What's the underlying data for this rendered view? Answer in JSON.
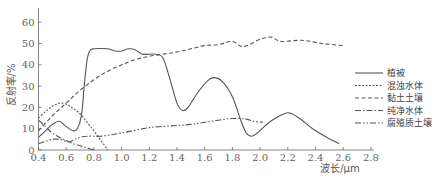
{
  "chart_data": {
    "type": "line",
    "title": "",
    "xlabel": "波长/μm",
    "ylabel": "反射率/%",
    "xlim": [
      0.4,
      2.8
    ],
    "ylim": [
      0,
      65
    ],
    "xticks": [
      0.4,
      0.6,
      0.8,
      1.0,
      1.2,
      1.4,
      1.6,
      1.8,
      2.0,
      2.2,
      2.4,
      2.6,
      2.8
    ],
    "xtick_labels": [
      "0.4",
      "0.6",
      "0.8",
      "1.0",
      "1.2",
      "1.4",
      "1.6",
      "1.8",
      "2.0",
      "2.2",
      "2.4",
      "2.6",
      "2.8"
    ],
    "yticks": [
      0,
      10,
      20,
      30,
      40,
      50,
      60
    ],
    "ytick_labels": [
      "0",
      "10",
      "20",
      "30",
      "40",
      "50",
      "60"
    ],
    "grid": false,
    "legend_position": "right",
    "series": [
      {
        "name": "植被",
        "style": "solid",
        "points": [
          [
            0.4,
            6
          ],
          [
            0.45,
            9
          ],
          [
            0.5,
            12
          ],
          [
            0.55,
            13.5
          ],
          [
            0.6,
            11
          ],
          [
            0.65,
            9
          ],
          [
            0.68,
            10
          ],
          [
            0.71,
            16
          ],
          [
            0.73,
            30
          ],
          [
            0.75,
            42
          ],
          [
            0.77,
            46.5
          ],
          [
            0.8,
            47.5
          ],
          [
            0.9,
            47.5
          ],
          [
            0.95,
            46.5
          ],
          [
            1.0,
            46.5
          ],
          [
            1.05,
            47.5
          ],
          [
            1.1,
            47
          ],
          [
            1.15,
            45
          ],
          [
            1.25,
            45
          ],
          [
            1.3,
            43
          ],
          [
            1.35,
            33
          ],
          [
            1.4,
            22
          ],
          [
            1.44,
            18.5
          ],
          [
            1.48,
            20
          ],
          [
            1.55,
            27
          ],
          [
            1.62,
            32.5
          ],
          [
            1.67,
            34
          ],
          [
            1.73,
            32
          ],
          [
            1.8,
            25
          ],
          [
            1.86,
            14
          ],
          [
            1.9,
            8
          ],
          [
            1.94,
            6.5
          ],
          [
            1.98,
            8
          ],
          [
            2.03,
            11
          ],
          [
            2.1,
            14.5
          ],
          [
            2.2,
            17.5
          ],
          [
            2.28,
            15
          ],
          [
            2.38,
            10
          ],
          [
            2.48,
            6
          ],
          [
            2.57,
            3
          ]
        ]
      },
      {
        "name": "混浊水体",
        "style": "dotted",
        "points": [
          [
            0.4,
            15
          ],
          [
            0.45,
            18
          ],
          [
            0.5,
            20.5
          ],
          [
            0.55,
            22
          ],
          [
            0.6,
            21.5
          ],
          [
            0.65,
            19.5
          ],
          [
            0.7,
            17
          ],
          [
            0.75,
            13
          ],
          [
            0.8,
            9
          ],
          [
            0.85,
            4.5
          ],
          [
            0.9,
            0
          ]
        ]
      },
      {
        "name": "黏土土壤",
        "style": "dashed",
        "points": [
          [
            0.4,
            9
          ],
          [
            0.5,
            16
          ],
          [
            0.6,
            22
          ],
          [
            0.7,
            28
          ],
          [
            0.8,
            33
          ],
          [
            0.9,
            37
          ],
          [
            1.0,
            40
          ],
          [
            1.1,
            42.5
          ],
          [
            1.2,
            44
          ],
          [
            1.3,
            45
          ],
          [
            1.4,
            46
          ],
          [
            1.5,
            47.5
          ],
          [
            1.6,
            49
          ],
          [
            1.7,
            49.5
          ],
          [
            1.8,
            51
          ],
          [
            1.88,
            48.5
          ],
          [
            2.0,
            52
          ],
          [
            2.08,
            53
          ],
          [
            2.15,
            51
          ],
          [
            2.3,
            51.5
          ],
          [
            2.45,
            50
          ],
          [
            2.6,
            49
          ]
        ]
      },
      {
        "name": "纯净水体",
        "style": "dashdot",
        "points": [
          [
            0.4,
            14
          ],
          [
            0.45,
            11
          ],
          [
            0.5,
            8
          ],
          [
            0.55,
            6
          ],
          [
            0.6,
            4.5
          ],
          [
            0.65,
            3
          ],
          [
            0.7,
            2
          ],
          [
            0.75,
            1
          ],
          [
            0.8,
            0
          ]
        ]
      },
      {
        "name": "腐殖质土壤",
        "style": "dashdotdot",
        "points": [
          [
            0.4,
            3
          ],
          [
            0.45,
            4
          ],
          [
            0.5,
            5
          ],
          [
            0.55,
            5
          ],
          [
            0.6,
            4
          ],
          [
            0.63,
            4
          ],
          [
            0.68,
            5.5
          ],
          [
            0.75,
            6.5
          ],
          [
            0.85,
            6.5
          ],
          [
            1.0,
            8
          ],
          [
            1.2,
            10.5
          ],
          [
            1.4,
            11.5
          ],
          [
            1.5,
            12
          ],
          [
            1.6,
            13
          ],
          [
            1.7,
            14
          ],
          [
            1.8,
            14.8
          ],
          [
            1.9,
            14.5
          ],
          [
            1.95,
            13.5
          ],
          [
            2.02,
            13
          ]
        ]
      }
    ]
  }
}
